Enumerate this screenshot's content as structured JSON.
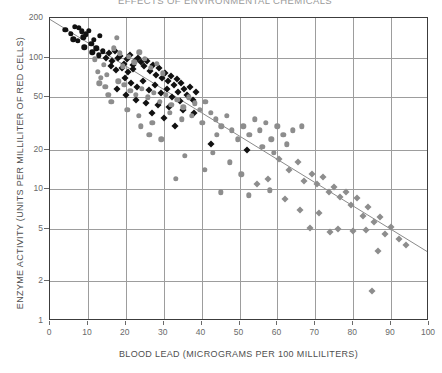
{
  "figure": {
    "title_fragment": "EFFECTS OF ENVIRONMENTAL CHEMICALS",
    "xaxis_title": "BLOOD LEAD (MICROGRAMS PER 100 MILLILITERS)",
    "yaxis_title": "ENZYME ACTIVITY (UNITS PER MILLILITER OF RED CELLS)"
  },
  "chart_data": {
    "type": "scatter",
    "title": "EFFECTS OF ENVIRONMENTAL CHEMICALS",
    "xlabel": "BLOOD LEAD (MICROGRAMS PER 100 MILLILITERS)",
    "ylabel": "ENZYME ACTIVITY (UNITS PER MILLILITER OF RED CELLS)",
    "xscale": "linear",
    "yscale": "log",
    "xlim": [
      0,
      100
    ],
    "ylim": [
      1,
      200
    ],
    "xticks": [
      0,
      10,
      20,
      30,
      40,
      50,
      60,
      70,
      80,
      90,
      100
    ],
    "yticks": [
      1,
      2,
      5,
      10,
      20,
      50,
      100,
      200
    ],
    "grid": "both",
    "legend": "none",
    "colors": {
      "dark_marker": "#111111",
      "light_marker": "#8d8d8d",
      "grid": "#9d9d9d",
      "frame": "#3c3c3c",
      "regression": "#8a8a8a"
    },
    "regression_line": {
      "label": "fitted regression line",
      "x": [
        0,
        100
      ],
      "y": [
        195,
        3.3
      ]
    },
    "series": [
      {
        "name": "Group A (dark circles)",
        "marker": "circle",
        "color": "#111111",
        "points": [
          [
            4.0,
            163
          ],
          [
            5.5,
            152
          ],
          [
            6.5,
            172
          ],
          [
            7.6,
            168
          ],
          [
            8.4,
            158
          ],
          [
            6.2,
            138
          ],
          [
            7.3,
            134
          ],
          [
            8.8,
            143
          ],
          [
            9.4,
            150
          ],
          [
            10.3,
            160
          ],
          [
            10.9,
            128
          ],
          [
            11.6,
            137
          ],
          [
            12.2,
            118
          ],
          [
            9.0,
            120
          ],
          [
            13.1,
            146
          ],
          [
            11.2,
            110
          ],
          [
            12.8,
            104
          ],
          [
            14.0,
            112
          ]
        ]
      },
      {
        "name": "Group B (dark diamonds)",
        "marker": "diamond",
        "color": "#111111",
        "points": [
          [
            14.8,
            100
          ],
          [
            15.6,
            108
          ],
          [
            16.4,
            95
          ],
          [
            17.1,
            112
          ],
          [
            17.9,
            99
          ],
          [
            18.6,
            103
          ],
          [
            19.4,
            90
          ],
          [
            20.2,
            97
          ],
          [
            21.0,
            105
          ],
          [
            21.8,
            88
          ],
          [
            22.5,
            94
          ],
          [
            16.0,
            86
          ],
          [
            17.4,
            80
          ],
          [
            18.9,
            84
          ],
          [
            20.6,
            78
          ],
          [
            22.0,
            82
          ],
          [
            23.3,
            100
          ],
          [
            24.1,
            92
          ],
          [
            24.9,
            86
          ],
          [
            25.6,
            95
          ],
          [
            26.4,
            79
          ],
          [
            27.2,
            88
          ],
          [
            28.0,
            74
          ],
          [
            28.8,
            83
          ],
          [
            29.5,
            70
          ],
          [
            30.3,
            77
          ],
          [
            31.1,
            66
          ],
          [
            31.9,
            72
          ],
          [
            32.6,
            62
          ],
          [
            33.4,
            69
          ],
          [
            19.8,
            70
          ],
          [
            21.4,
            64
          ],
          [
            23.0,
            60
          ],
          [
            24.5,
            66
          ],
          [
            26.0,
            57
          ],
          [
            27.6,
            62
          ],
          [
            29.2,
            54
          ],
          [
            30.8,
            58
          ],
          [
            32.2,
            50
          ],
          [
            33.8,
            55
          ],
          [
            34.6,
            64
          ],
          [
            35.4,
            58
          ],
          [
            36.1,
            52
          ],
          [
            36.9,
            60
          ],
          [
            37.7,
            48
          ],
          [
            38.5,
            55
          ],
          [
            17.8,
            58
          ],
          [
            20.0,
            52
          ],
          [
            22.8,
            48
          ],
          [
            25.2,
            45
          ],
          [
            28.4,
            44
          ],
          [
            31.4,
            42
          ],
          [
            34.2,
            47
          ],
          [
            35.0,
            40
          ],
          [
            26.8,
            38
          ],
          [
            30.0,
            35
          ],
          [
            33.0,
            30
          ],
          [
            38.0,
            38
          ],
          [
            42.5,
            22
          ],
          [
            52.0,
            20
          ]
        ]
      },
      {
        "name": "Group C (light circles)",
        "marker": "circle",
        "color": "#8d8d8d",
        "points": [
          [
            11.8,
            97
          ],
          [
            12.6,
            78
          ],
          [
            13.4,
            70
          ],
          [
            14.2,
            88
          ],
          [
            15.0,
            74
          ],
          [
            13.0,
            64
          ],
          [
            14.6,
            60
          ],
          [
            16.8,
            118
          ],
          [
            17.6,
            141
          ],
          [
            18.4,
            108
          ],
          [
            19.2,
            86
          ],
          [
            20.8,
            102
          ],
          [
            22.2,
            92
          ],
          [
            23.6,
            110
          ],
          [
            25.0,
            98
          ],
          [
            26.6,
            84
          ],
          [
            28.2,
            90
          ],
          [
            29.8,
            76
          ],
          [
            18.0,
            66
          ],
          [
            19.6,
            62
          ],
          [
            21.2,
            56
          ],
          [
            22.6,
            52
          ],
          [
            24.2,
            58
          ],
          [
            25.8,
            50
          ],
          [
            27.4,
            54
          ],
          [
            29.0,
            46
          ],
          [
            30.6,
            52
          ],
          [
            32.0,
            44
          ],
          [
            33.6,
            48
          ],
          [
            35.2,
            42
          ],
          [
            36.6,
            50
          ],
          [
            38.2,
            45
          ],
          [
            39.6,
            40
          ],
          [
            41.0,
            46
          ],
          [
            42.4,
            38
          ],
          [
            31.6,
            38
          ],
          [
            34.8,
            34
          ],
          [
            37.4,
            36
          ],
          [
            40.2,
            32
          ],
          [
            43.8,
            34
          ],
          [
            45.2,
            30
          ],
          [
            46.6,
            36
          ],
          [
            48.0,
            28
          ],
          [
            44.0,
            26
          ],
          [
            49.5,
            24
          ],
          [
            51.0,
            30
          ],
          [
            52.6,
            26
          ],
          [
            54.0,
            34
          ],
          [
            55.4,
            28
          ],
          [
            57.0,
            32
          ],
          [
            58.4,
            24
          ],
          [
            60.0,
            30
          ],
          [
            61.6,
            26
          ],
          [
            56.0,
            21
          ],
          [
            59.0,
            19
          ],
          [
            62.5,
            22
          ],
          [
            64.0,
            28
          ],
          [
            29.4,
            24
          ],
          [
            35.6,
            18
          ],
          [
            40.8,
            14
          ],
          [
            33.2,
            12
          ],
          [
            45.0,
            9.5
          ],
          [
            52.5,
            9.0
          ],
          [
            58.0,
            9.8
          ],
          [
            66.5,
            30
          ],
          [
            43.0,
            19
          ],
          [
            47.5,
            16
          ],
          [
            50.5,
            13
          ],
          [
            24.0,
            30
          ],
          [
            26.2,
            26
          ],
          [
            16.2,
            46
          ],
          [
            15.4,
            52
          ],
          [
            20.4,
            40
          ],
          [
            23.4,
            36
          ],
          [
            27.0,
            32
          ]
        ]
      },
      {
        "name": "Group D (light diamonds)",
        "marker": "diamond",
        "color": "#8d8d8d",
        "points": [
          [
            60.5,
            17
          ],
          [
            63.0,
            14
          ],
          [
            65.5,
            16
          ],
          [
            67.0,
            11.5
          ],
          [
            69.0,
            13
          ],
          [
            70.5,
            11
          ],
          [
            72.0,
            12.5
          ],
          [
            73.5,
            9.5
          ],
          [
            75.0,
            10.5
          ],
          [
            76.5,
            8.8
          ],
          [
            78.0,
            9.6
          ],
          [
            79.5,
            7.6
          ],
          [
            81.0,
            8.6
          ],
          [
            82.5,
            6.3
          ],
          [
            84.0,
            7.4
          ],
          [
            85.5,
            5.6
          ],
          [
            87.0,
            6.2
          ],
          [
            88.5,
            4.6
          ],
          [
            90.0,
            5.2
          ],
          [
            92.0,
            4.2
          ],
          [
            94.0,
            3.8
          ],
          [
            66.0,
            7.0
          ],
          [
            71.0,
            6.6
          ],
          [
            76.0,
            5.0
          ],
          [
            80.0,
            4.8
          ],
          [
            83.5,
            4.9
          ],
          [
            86.5,
            3.4
          ],
          [
            62.0,
            8.4
          ],
          [
            68.5,
            5.1
          ],
          [
            74.0,
            4.7
          ],
          [
            85.0,
            1.7
          ],
          [
            57.5,
            12.0
          ],
          [
            54.5,
            11.0
          ]
        ]
      }
    ]
  }
}
